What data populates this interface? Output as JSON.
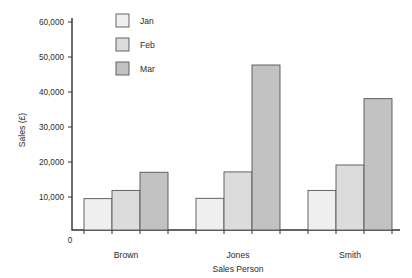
{
  "chart_data": {
    "type": "bar",
    "title": "",
    "subtitle": "",
    "xlabel": "Sales Person",
    "ylabel": "Sales (£)",
    "categories": [
      "Brown",
      "Jones",
      "Smith"
    ],
    "series": [
      {
        "name": "Jan",
        "values": [
          9500,
          9600,
          12000
        ],
        "color": "#efefef"
      },
      {
        "name": "Feb",
        "values": [
          12000,
          17600,
          19700
        ],
        "color": "#dcdcdc"
      },
      {
        "name": "Mar",
        "values": [
          17500,
          50000,
          39800
        ],
        "color": "#c2c2c2"
      }
    ],
    "ylim": [
      0,
      62000
    ],
    "yticks": [
      10000,
      20000,
      30000,
      40000,
      50000,
      60000
    ],
    "ytick_labels": [
      "10,000",
      "20,000",
      "30,000",
      "40,000",
      "50,000",
      "60,000"
    ],
    "zero_label": "0",
    "grid": false,
    "legend_position": "top-center-left",
    "bar_stroke_color": "#555555",
    "axis_color": "#333333",
    "background": "#ffffff"
  },
  "legend": {
    "entries": [
      {
        "label": "Jan",
        "color": "#efefef"
      },
      {
        "label": "Feb",
        "color": "#dcdcdc"
      },
      {
        "label": "Mar",
        "color": "#c2c2c2"
      }
    ]
  }
}
